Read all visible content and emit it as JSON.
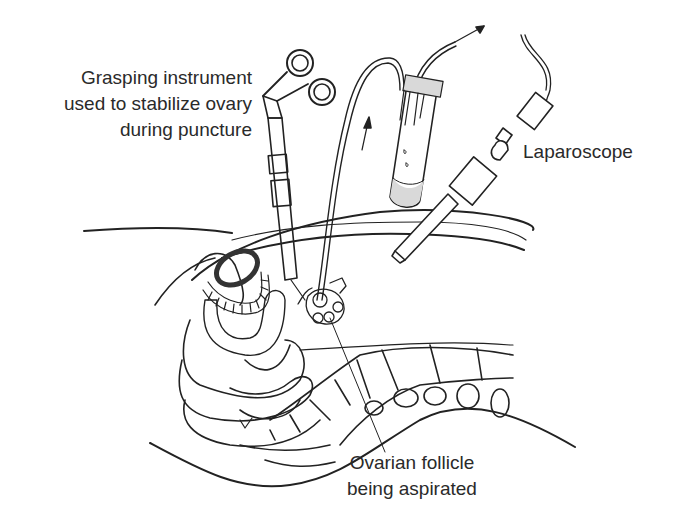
{
  "figure": {
    "type": "medical-illustration",
    "colors": {
      "line": "#222222",
      "fill_grey": "#d9d9d9",
      "background": "#ffffff"
    }
  },
  "labels": {
    "grasping_instrument": {
      "line1": "Grasping instrument",
      "line2": "used to stabilize ovary",
      "line3": "during puncture"
    },
    "laparoscope": {
      "text": "Laparoscope"
    },
    "ovarian_follicle": {
      "line1": "Ovarian follicle",
      "line2": "being aspirated"
    }
  },
  "components": [
    {
      "name": "grasping-instrument",
      "icon": "scissors-handle-icon"
    },
    {
      "name": "aspiration-needle",
      "icon": "needle-icon"
    },
    {
      "name": "collection-test-tube",
      "icon": "test-tube-icon"
    },
    {
      "name": "suction-arrow",
      "icon": "arrow-up-right-icon"
    },
    {
      "name": "flow-arrow",
      "icon": "arrow-up-icon"
    },
    {
      "name": "laparoscope",
      "icon": "laparoscope-icon"
    },
    {
      "name": "abdominal-wall",
      "icon": "tissue-layer-icon"
    },
    {
      "name": "uterus",
      "icon": "uterus-icon"
    },
    {
      "name": "ovary",
      "icon": "ovary-icon"
    },
    {
      "name": "spine",
      "icon": "vertebrae-icon"
    }
  ]
}
